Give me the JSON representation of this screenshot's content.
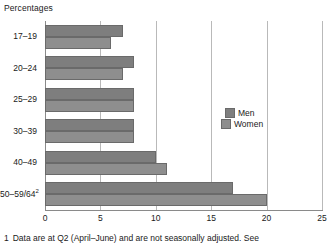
{
  "units_label": "Percentages",
  "footnote": {
    "marker": "1",
    "text": "Data are at Q2 (April–June) and are not seasonally adjusted. See"
  },
  "legend": {
    "position": "inside-right",
    "entries": [
      {
        "label": "Men",
        "color": "#7e7e7e"
      },
      {
        "label": "Women",
        "color": "#8e8e8e"
      }
    ]
  },
  "axis": {
    "x_ticks": [
      "0",
      "5",
      "10",
      "15",
      "20",
      "25"
    ]
  },
  "chart_data": {
    "type": "bar",
    "orientation": "horizontal",
    "title": "",
    "subtitle": "",
    "xlabel": "",
    "ylabel": "",
    "units": "Percentages",
    "xlim": [
      0,
      25
    ],
    "xticks": [
      0,
      5,
      10,
      15,
      20,
      25
    ],
    "grid": "vertical",
    "legend_position": "inside-right",
    "categories": [
      "17–19",
      "20–24",
      "25–29",
      "30–39",
      "40–49",
      "50–59/64"
    ],
    "category_footnotes": [
      "",
      "",
      "",
      "",
      "",
      "2"
    ],
    "series": [
      {
        "name": "Men",
        "color": "#7e7e7e",
        "values": [
          7,
          8,
          8,
          8,
          10,
          17
        ]
      },
      {
        "name": "Women",
        "color": "#8e8e8e",
        "values": [
          6,
          7,
          8,
          8,
          11,
          20
        ]
      }
    ]
  }
}
